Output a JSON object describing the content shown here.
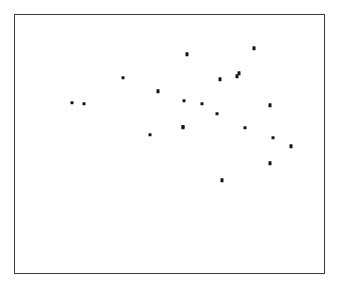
{
  "figure": {
    "background_color": "#ffffff",
    "frame_color": "#3a3a3a",
    "point_color": "#151515",
    "frame": {
      "left": 14,
      "top": 14,
      "width": 311,
      "height": 260
    }
  },
  "chart_data": {
    "type": "scatter",
    "title": "",
    "subtitle": "",
    "xlabel": "",
    "ylabel": "",
    "grid": false,
    "legend": null,
    "axis_ticks": {
      "x": [],
      "y": []
    },
    "xlim": [
      0,
      100
    ],
    "ylim": [
      0,
      100
    ],
    "note": "Axes are unlabeled; values are expressed as percent positions within the plot frame, with y measured upward from the frame bottom.",
    "series": [
      {
        "name": "observations",
        "marker": "square",
        "n_points": 21,
        "points": [
          {
            "x": 18.2,
            "y": 66.3
          },
          {
            "x": 22.3,
            "y": 65.9
          },
          {
            "x": 34.8,
            "y": 76.0
          },
          {
            "x": 43.4,
            "y": 54.2
          },
          {
            "x": 45.9,
            "y": 70.8
          },
          {
            "x": 54.0,
            "y": 57.1
          },
          {
            "x": 55.4,
            "y": 84.9
          },
          {
            "x": 60.0,
            "y": 66.0
          },
          {
            "x": 65.0,
            "y": 62.0
          },
          {
            "x": 66.0,
            "y": 75.0
          },
          {
            "x": 66.4,
            "y": 36.4
          },
          {
            "x": 71.4,
            "y": 76.6
          },
          {
            "x": 73.9,
            "y": 56.9
          },
          {
            "x": 76.7,
            "y": 87.7
          },
          {
            "x": 81.9,
            "y": 65.3
          },
          {
            "x": 81.9,
            "y": 43.0
          },
          {
            "x": 83.0,
            "y": 52.8
          },
          {
            "x": 88.6,
            "y": 49.6
          },
          {
            "x": 57.3,
            "y": 80.0
          },
          {
            "x": 53.6,
            "y": 48.2
          },
          {
            "x": 70.9,
            "y": 39.5
          }
        ]
      }
    ]
  },
  "pixel_points": [
    {
      "cx": 70.7,
      "cy": 101.7
    },
    {
      "cx": 83.3,
      "cy": 102.7
    },
    {
      "cx": 122.3,
      "cy": 76.5
    },
    {
      "cx": 149.0,
      "cy": 133.5
    },
    {
      "cx": 156.7,
      "cy": 90.0
    },
    {
      "cx": 182.0,
      "cy": 126.3
    },
    {
      "cx": 186.3,
      "cy": 53.3
    },
    {
      "cx": 200.7,
      "cy": 102.5
    },
    {
      "cx": 216.0,
      "cy": 112.7
    },
    {
      "cx": 219.3,
      "cy": 78.0
    },
    {
      "cx": 220.7,
      "cy": 179.3
    },
    {
      "cx": 236.0,
      "cy": 75.0
    },
    {
      "cx": 244.0,
      "cy": 126.7
    },
    {
      "cx": 252.7,
      "cy": 47.0
    },
    {
      "cx": 269.0,
      "cy": 104.3
    },
    {
      "cx": 269.0,
      "cy": 162.3
    },
    {
      "cx": 272.3,
      "cy": 136.7
    },
    {
      "cx": 289.7,
      "cy": 145.0
    },
    {
      "cx": 238.0,
      "cy": 72.3
    },
    {
      "cx": 183.0,
      "cy": 99.7
    },
    {
      "cx": 181.7,
      "cy": 125.7
    }
  ]
}
